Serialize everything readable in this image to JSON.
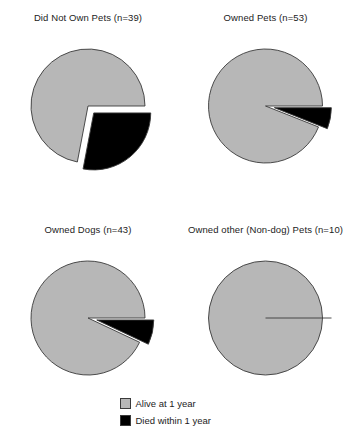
{
  "figure": {
    "background": "#ffffff",
    "alive_color": "#b7b7b7",
    "died_color": "#000000",
    "outline_color": "#3a3a3a"
  },
  "legend": {
    "items": [
      {
        "label": "Alive at 1 year",
        "color": "#b7b7b7",
        "key": "alive"
      },
      {
        "label": "Died within 1 year",
        "color": "#000000",
        "key": "died"
      }
    ]
  },
  "panels": [
    {
      "title": "Did Not Own Pets (n=39)",
      "group": "Did Not Own Pets",
      "n": 39,
      "slices": [
        {
          "label": "Alive at 1 year",
          "percent": 72,
          "color": "#b7b7b7",
          "exploded": false
        },
        {
          "label": "Died within 1 year",
          "percent": 28,
          "color": "#000000",
          "exploded": true
        }
      ]
    },
    {
      "title": "Owned Pets (n=53)",
      "group": "Owned Pets",
      "n": 53,
      "slices": [
        {
          "label": "Alive at 1 year",
          "percent": 94,
          "color": "#b7b7b7",
          "exploded": false
        },
        {
          "label": "Died within 1 year",
          "percent": 6,
          "color": "#000000",
          "exploded": true
        }
      ]
    },
    {
      "title": "Owned Dogs (n=43)",
      "group": "Owned Dogs",
      "n": 43,
      "slices": [
        {
          "label": "Alive at 1 year",
          "percent": 93,
          "color": "#b7b7b7",
          "exploded": false
        },
        {
          "label": "Died within 1 year",
          "percent": 7,
          "color": "#000000",
          "exploded": true
        }
      ]
    },
    {
      "title": "Owned other (Non-dog) Pets (n=10)",
      "group": "Owned other (Non-dog) Pets",
      "n": 10,
      "slices": [
        {
          "label": "Alive at 1 year",
          "percent": 100,
          "color": "#b7b7b7",
          "exploded": false
        },
        {
          "label": "Died within 1 year",
          "percent": 0,
          "color": "#000000",
          "exploded": true
        }
      ]
    }
  ],
  "chart_data": {
    "type": "pie",
    "title": "",
    "subtitle": "",
    "legend_position": "bottom-center",
    "grid": false,
    "categories": [
      "Alive at 1 year",
      "Died within 1 year"
    ],
    "colors": [
      "#b7b7b7",
      "#000000"
    ],
    "units": "percent",
    "panels": [
      {
        "title": "Did Not Own Pets (n=39)",
        "n": 39,
        "values": [
          72,
          28
        ],
        "counts": [
          28,
          11
        ]
      },
      {
        "title": "Owned Pets (n=53)",
        "n": 53,
        "values": [
          94,
          6
        ],
        "counts": [
          50,
          3
        ]
      },
      {
        "title": "Owned Dogs (n=43)",
        "n": 43,
        "values": [
          93,
          7
        ],
        "counts": [
          40,
          3
        ]
      },
      {
        "title": "Owned other (Non-dog) Pets (n=10)",
        "n": 10,
        "values": [
          100,
          0
        ],
        "counts": [
          10,
          0
        ]
      }
    ]
  }
}
